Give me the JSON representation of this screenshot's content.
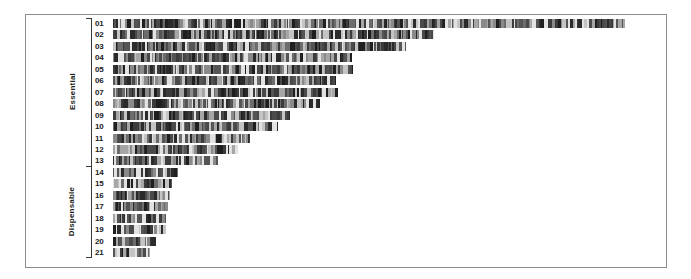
{
  "figure": {
    "background_color": "#ffffff",
    "frame_color": "#8c8c8c",
    "bar_color": "#3f3f3f",
    "label_color": "#1a1a1a"
  },
  "axis": {
    "groups": [
      {
        "name": "essential-group",
        "label": "Essential",
        "first_row": 1,
        "last_row": 13
      },
      {
        "name": "dispensable-group",
        "label": "Dispensable",
        "first_row": 14,
        "last_row": 21
      }
    ]
  },
  "chart_data": {
    "type": "bar",
    "title": "",
    "xlabel": "",
    "ylabel": "",
    "orientation": "horizontal",
    "grid": false,
    "legend": "none",
    "axis_origin_px": 113,
    "categories": [
      "01",
      "02",
      "03",
      "04",
      "05",
      "06",
      "07",
      "08",
      "09",
      "10",
      "11",
      "12",
      "13",
      "14",
      "15",
      "16",
      "17",
      "18",
      "19",
      "20",
      "21"
    ],
    "values": [
      512,
      321,
      293,
      239,
      240,
      223,
      225,
      207,
      177,
      165,
      137,
      125,
      105,
      65,
      59,
      57,
      55,
      53,
      53,
      43,
      37
    ],
    "group_of_category": [
      "Essential",
      "Essential",
      "Essential",
      "Essential",
      "Essential",
      "Essential",
      "Essential",
      "Essential",
      "Essential",
      "Essential",
      "Essential",
      "Essential",
      "Essential",
      "Dispensable",
      "Dispensable",
      "Dispensable",
      "Dispensable",
      "Dispensable",
      "Dispensable",
      "Dispensable",
      "Dispensable"
    ],
    "xlim": [
      0,
      512
    ],
    "ylim": [
      0,
      21
    ],
    "bar_texture": "vertical-stripes"
  }
}
